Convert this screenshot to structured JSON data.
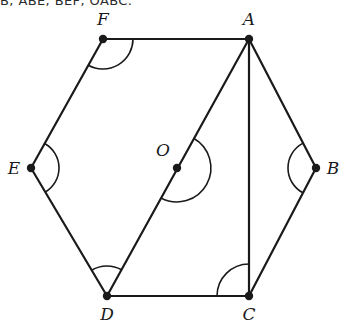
{
  "header": {
    "text": "B, ABE, BEF, OABC."
  },
  "figure": {
    "stroke_color": "#1a1a1a",
    "fill_color": "none",
    "background_color": "#ffffff",
    "stroke_width": 2.2,
    "arc_stroke_width": 1.6,
    "vertex_dot_radius": 4.2,
    "vertices": [
      {
        "id": "A",
        "label": "A",
        "x": 249,
        "y": 39,
        "label_x": 249,
        "label_y": 25,
        "dot": true
      },
      {
        "id": "B",
        "label": "B",
        "x": 316,
        "y": 168,
        "label_x": 333,
        "label_y": 174,
        "dot": true
      },
      {
        "id": "C",
        "label": "C",
        "x": 249,
        "y": 296,
        "label_x": 249,
        "label_y": 320,
        "dot": true
      },
      {
        "id": "D",
        "label": "D",
        "x": 107,
        "y": 296,
        "label_x": 107,
        "label_y": 320,
        "dot": true
      },
      {
        "id": "E",
        "label": "E",
        "x": 31,
        "y": 168,
        "label_x": 14,
        "label_y": 174,
        "dot": true
      },
      {
        "id": "F",
        "label": "F",
        "x": 103,
        "y": 39,
        "label_x": 103,
        "label_y": 25,
        "dot": true
      },
      {
        "id": "O",
        "label": "O",
        "x": 177,
        "y": 168,
        "label_x": 163,
        "label_y": 156,
        "dot": true
      }
    ],
    "edges": [
      {
        "name": "edge-FA",
        "from": "F",
        "to": "A"
      },
      {
        "name": "edge-AB",
        "from": "A",
        "to": "B"
      },
      {
        "name": "edge-BC",
        "from": "B",
        "to": "C"
      },
      {
        "name": "edge-CD",
        "from": "C",
        "to": "D"
      },
      {
        "name": "edge-DE",
        "from": "D",
        "to": "E"
      },
      {
        "name": "edge-EF",
        "from": "E",
        "to": "F"
      }
    ],
    "diagonals": [
      {
        "name": "diagonal-AD",
        "from": "A",
        "to": "D",
        "through": "O"
      },
      {
        "name": "diagonal-AC",
        "from": "A",
        "to": "C"
      }
    ],
    "angle_marks": [
      {
        "name": "angle-F",
        "vertex": "F",
        "radius": 30,
        "measure_deg": 120,
        "note": "interior angle EFA"
      },
      {
        "name": "angle-A",
        "vertex": "A",
        "radius": 0,
        "measure_deg": 120,
        "note": "split by diagonals, no arc drawn"
      },
      {
        "name": "angle-B",
        "vertex": "B",
        "radius": 28,
        "measure_deg": 120,
        "note": "interior angle ABC"
      },
      {
        "name": "angle-E",
        "vertex": "E",
        "radius": 28,
        "measure_deg": 120,
        "note": "interior angle DEF"
      },
      {
        "name": "angle-D",
        "vertex": "D",
        "radius": 30,
        "measure_deg": 60,
        "note": "angle EDA"
      },
      {
        "name": "angle-C",
        "vertex": "C",
        "radius": 32,
        "measure_deg": 90,
        "note": "angle DCA"
      },
      {
        "name": "angle-O",
        "vertex": "O",
        "radius": 34,
        "measure_deg": 180,
        "note": "straight angle at O on diagonal AD"
      }
    ]
  }
}
